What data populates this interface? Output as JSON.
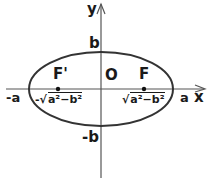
{
  "diagram": {
    "type": "ellipse-with-foci",
    "axes": {
      "x_label": "x",
      "y_label": "y"
    },
    "origin_label": "O",
    "vertices": {
      "left": "-a",
      "right": "a",
      "top": "b",
      "bottom": "-b"
    },
    "foci": [
      {
        "label": "F'",
        "coordinate_sign": "-",
        "coordinate": "a²−b²"
      },
      {
        "label": "F",
        "coordinate_sign": "",
        "coordinate": "a²−b²"
      }
    ],
    "colors": {
      "stroke": "#333333",
      "axis": "#555555",
      "text": "#1a1a1a"
    }
  }
}
